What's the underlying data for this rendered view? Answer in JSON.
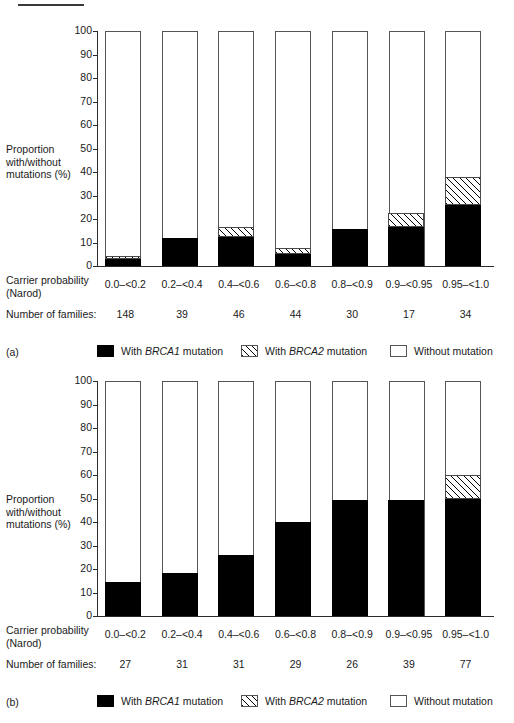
{
  "figure": {
    "top_divider": true,
    "clipped_header_text": ""
  },
  "axis": {
    "y_caption_line1": "Proportion",
    "y_caption_line2": "with/without",
    "y_caption_line3": "mutations (%)",
    "y_ticks": [
      "100",
      "90",
      "80",
      "70",
      "60",
      "50",
      "40",
      "30",
      "20",
      "10",
      "0"
    ],
    "y_min": 0,
    "y_max": 100,
    "x_caption_line1": "Carrier probability",
    "x_caption_line2": "(Narod)",
    "families_label": "Number of families:"
  },
  "legend": {
    "items": [
      {
        "swatch": "black",
        "prefix": "With ",
        "gene": "BRCA1",
        "suffix": " mutation"
      },
      {
        "swatch": "hatch",
        "prefix": "With ",
        "gene": "BRCA2",
        "suffix": " mutation"
      },
      {
        "swatch": "white",
        "prefix": "Without mutation",
        "gene": "",
        "suffix": ""
      }
    ]
  },
  "chart_data": [
    {
      "id": "a",
      "panel_label": "(a)",
      "type": "bar",
      "stacked": true,
      "title": "",
      "xlabel": "Carrier probability (Narod)",
      "ylabel": "Proportion with/without mutations (%)",
      "ylim": [
        0,
        100
      ],
      "grid": false,
      "legend_position": "below",
      "categories": [
        "0.0–<0.2",
        "0.2–<0.4",
        "0.4–<0.6",
        "0.6–<0.8",
        "0.8–<0.9",
        "0.9–<0.95",
        "0.95–<1.0"
      ],
      "number_of_families": [
        148,
        39,
        46,
        44,
        30,
        17,
        34
      ],
      "series": [
        {
          "name": "With BRCA1 mutation",
          "fill": "black",
          "values": [
            3,
            12,
            12.5,
            5,
            16,
            16.5,
            26
          ]
        },
        {
          "name": "With BRCA2 mutation",
          "fill": "hatch",
          "values": [
            1.5,
            0,
            4,
            2.5,
            0,
            6,
            12
          ]
        },
        {
          "name": "Without mutation",
          "fill": "white",
          "values": [
            95.5,
            88,
            83.5,
            92.5,
            84,
            77.5,
            62
          ]
        }
      ]
    },
    {
      "id": "b",
      "panel_label": "(b)",
      "type": "bar",
      "stacked": true,
      "title": "",
      "xlabel": "Carrier probability (Narod)",
      "ylabel": "Proportion with/without mutations (%)",
      "ylim": [
        0,
        100
      ],
      "grid": false,
      "legend_position": "below",
      "categories": [
        "0.0–<0.2",
        "0.2–<0.4",
        "0.4–<0.6",
        "0.6–<0.8",
        "0.8–<0.9",
        "0.9–<0.95",
        "0.95–<1.0"
      ],
      "number_of_families": [
        27,
        31,
        31,
        29,
        26,
        39,
        77
      ],
      "series": [
        {
          "name": "With BRCA1 mutation",
          "fill": "black",
          "values": [
            14.5,
            18.5,
            26,
            40,
            49.5,
            49.5,
            50
          ]
        },
        {
          "name": "With BRCA2 mutation",
          "fill": "hatch",
          "values": [
            0,
            0,
            0,
            0,
            0,
            0,
            10
          ]
        },
        {
          "name": "Without mutation",
          "fill": "white",
          "values": [
            85.5,
            81.5,
            74,
            60,
            50.5,
            50.5,
            40
          ]
        }
      ]
    }
  ]
}
